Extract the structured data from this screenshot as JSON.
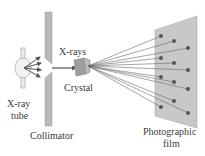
{
  "diagram": {
    "labels": {
      "xray_tube_line1": "X-ray",
      "xray_tube_line2": "tube",
      "collimator": "Collimator",
      "xrays": "X-rays",
      "crystal": "Crystal",
      "film_line1": "Photographic",
      "film_line2": "film"
    },
    "colors": {
      "collimator": "#b8b8b8",
      "film": "#c8c8c8",
      "spot": "#555555",
      "ray": "#6a6a6a",
      "text": "#3a3a3a"
    }
  }
}
